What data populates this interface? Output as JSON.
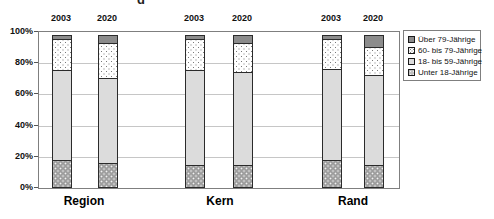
{
  "chart_data": {
    "type": "bar",
    "stacked": true,
    "unit": "%",
    "title_fragment": "g",
    "ylim": [
      0,
      100
    ],
    "grid": true,
    "legend_position": "right",
    "y_ticks": [
      "100%",
      "80%",
      "60%",
      "40%",
      "20%",
      "0%"
    ],
    "groups": [
      "Region",
      "Kern",
      "Rand"
    ],
    "years": [
      "2003",
      "2020"
    ],
    "legend": [
      "Über 79-Jährige",
      "60- bis 79-Jährige",
      "18- bis 59-Jährige",
      "Unter 18-Jährige"
    ],
    "stack_order_bottom_to_top": [
      "Unter 18-Jährige",
      "18- bis 59-Jährige",
      "60- bis 79-Jährige",
      "Über 79-Jährige"
    ],
    "bars": [
      {
        "group": "Region",
        "year": "2003",
        "segments_bottom_to_top": [
          18,
          58,
          21,
          3
        ]
      },
      {
        "group": "Region",
        "year": "2020",
        "segments_bottom_to_top": [
          16,
          55,
          23,
          6
        ]
      },
      {
        "group": "Kern",
        "year": "2003",
        "segments_bottom_to_top": [
          15,
          61,
          21,
          3
        ]
      },
      {
        "group": "Kern",
        "year": "2020",
        "segments_bottom_to_top": [
          15,
          60,
          19,
          6
        ]
      },
      {
        "group": "Rand",
        "year": "2003",
        "segments_bottom_to_top": [
          18,
          59,
          20,
          3
        ]
      },
      {
        "group": "Rand",
        "year": "2020",
        "segments_bottom_to_top": [
          15,
          58,
          19,
          8
        ]
      }
    ],
    "colors": {
      "ueber79": "#8c8c8c",
      "60_79_pattern": "white with gray dots",
      "18_59": "#dcdcdc",
      "unter18_pattern": "#9c9c9c with white dots",
      "gridline": "#c6c6c6",
      "plot_border": "#7f7f7f"
    }
  }
}
